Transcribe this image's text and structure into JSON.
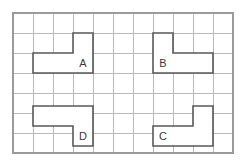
{
  "figure": {
    "type": "grid-polyomino-puzzle",
    "background_color": "#ffffff",
    "grid": {
      "origin_x": 13,
      "origin_y": 13,
      "cell_size": 20,
      "columns": 11,
      "rows": 7,
      "line_color": "#b9b9b9",
      "border_color": "#9a9a9a"
    },
    "piece_style": {
      "outline_color": "#585858",
      "fill_color": "#ffffff",
      "label_color": "#3a3a3a"
    }
  },
  "pieces": [
    {
      "label": "A",
      "shape": "L-tromino",
      "cells": [
        [
          1,
          2
        ],
        [
          2,
          2
        ],
        [
          3,
          2
        ],
        [
          3,
          1
        ]
      ],
      "points": "73,33 93,33 93,73 33,73 33,53 73,53",
      "label_x": 83,
      "label_y": 63
    },
    {
      "label": "B",
      "shape": "L-tromino",
      "cells": [
        [
          7,
          1
        ],
        [
          7,
          2
        ],
        [
          8,
          2
        ],
        [
          9,
          2
        ]
      ],
      "points": "153,33 173,33 173,53 213,53 213,73 153,73",
      "label_x": 163,
      "label_y": 63
    },
    {
      "label": "C",
      "shape": "L-tromino",
      "cells": [
        [
          9,
          5
        ],
        [
          7,
          6
        ],
        [
          8,
          6
        ],
        [
          9,
          6
        ]
      ],
      "points": "193,106 213,106 213,146 153,146 153,126 193,126",
      "label_x": 163,
      "label_y": 136
    },
    {
      "label": "D",
      "shape": "L-tromino",
      "cells": [
        [
          1,
          5
        ],
        [
          2,
          5
        ],
        [
          3,
          5
        ],
        [
          3,
          6
        ]
      ],
      "points": "33,106 93,106 93,146 73,146 73,126 33,126",
      "label_x": 83,
      "label_y": 136
    }
  ]
}
